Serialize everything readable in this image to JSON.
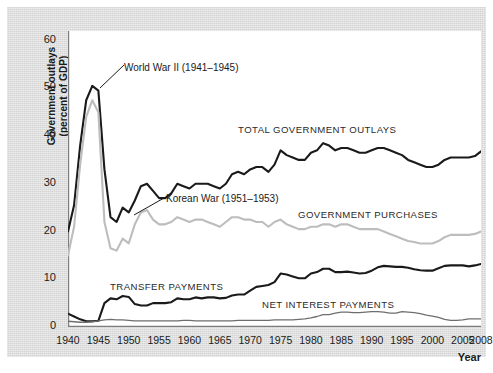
{
  "chart_data": {
    "type": "line",
    "title": "",
    "xlabel": "Year",
    "ylabel": "Government outlays\n(percent of GDP)",
    "xlim": [
      1940,
      2008
    ],
    "ylim": [
      0,
      62
    ],
    "ytick_values": [
      0,
      10,
      20,
      30,
      40,
      50,
      60
    ],
    "ytick_labels": [
      "0",
      "10",
      "20",
      "30",
      "40",
      "50",
      "60"
    ],
    "xtick_values": [
      1940,
      1945,
      1950,
      1955,
      1960,
      1965,
      1970,
      1975,
      1980,
      1985,
      1990,
      1995,
      2000,
      2005,
      2008
    ],
    "xtick_labels": [
      "1940",
      "1945",
      "1950",
      "1955",
      "1960",
      "1965",
      "1970",
      "1975",
      "1980",
      "1985",
      "1990",
      "1995",
      "2000",
      "2005",
      "2008"
    ],
    "grid": false,
    "legend_position": "inline-labels",
    "x": [
      1940,
      1941,
      1942,
      1943,
      1944,
      1945,
      1946,
      1947,
      1948,
      1949,
      1950,
      1951,
      1952,
      1953,
      1954,
      1955,
      1956,
      1957,
      1958,
      1959,
      1960,
      1961,
      1962,
      1963,
      1964,
      1965,
      1966,
      1967,
      1968,
      1969,
      1970,
      1971,
      1972,
      1973,
      1974,
      1975,
      1976,
      1977,
      1978,
      1979,
      1980,
      1981,
      1982,
      1983,
      1984,
      1985,
      1986,
      1987,
      1988,
      1989,
      1990,
      1991,
      1992,
      1993,
      1994,
      1995,
      1996,
      1997,
      1998,
      1999,
      2000,
      2001,
      2002,
      2003,
      2004,
      2005,
      2006,
      2007,
      2008
    ],
    "series": [
      {
        "name": "TOTAL GOVERNMENT OUTLAYS",
        "color": "#1a1a1a",
        "width": 2.1,
        "values": [
          20.0,
          25.5,
          38.0,
          47.5,
          50.5,
          49.5,
          33.0,
          23.0,
          22.0,
          25.0,
          24.0,
          26.5,
          29.5,
          30.0,
          28.5,
          27.0,
          27.0,
          28.0,
          30.0,
          29.5,
          29.0,
          30.0,
          30.0,
          30.0,
          29.5,
          29.0,
          30.0,
          32.0,
          32.5,
          32.0,
          33.0,
          33.5,
          33.5,
          32.5,
          34.0,
          37.0,
          36.0,
          35.5,
          35.0,
          35.0,
          36.5,
          37.0,
          38.5,
          38.0,
          37.0,
          37.5,
          37.5,
          37.0,
          36.5,
          36.5,
          37.0,
          37.5,
          37.5,
          37.0,
          36.5,
          36.0,
          35.0,
          34.5,
          34.0,
          33.5,
          33.5,
          34.0,
          35.0,
          35.5,
          35.5,
          35.5,
          35.5,
          35.8,
          36.8
        ]
      },
      {
        "name": "GOVERNMENT PURCHASES",
        "color": "#bdbdbd",
        "width": 2.1,
        "values": [
          15.0,
          21.0,
          34.0,
          44.0,
          47.5,
          45.0,
          22.0,
          16.5,
          16.0,
          18.5,
          17.5,
          21.5,
          24.0,
          24.5,
          22.5,
          21.5,
          21.5,
          22.0,
          23.0,
          22.5,
          22.0,
          22.5,
          22.5,
          22.0,
          21.5,
          21.0,
          22.0,
          23.0,
          23.0,
          22.5,
          22.5,
          22.0,
          22.0,
          21.0,
          22.0,
          22.5,
          21.5,
          21.0,
          20.5,
          20.5,
          21.0,
          21.0,
          21.5,
          21.5,
          21.0,
          21.5,
          21.5,
          21.0,
          20.5,
          20.5,
          20.5,
          20.5,
          20.0,
          19.5,
          19.0,
          18.5,
          18.0,
          17.8,
          17.5,
          17.5,
          17.5,
          18.0,
          18.8,
          19.3,
          19.3,
          19.3,
          19.3,
          19.5,
          20.0
        ]
      },
      {
        "name": "TRANSFER PAYMENTS",
        "color": "#1a1a1a",
        "width": 2.1,
        "values": [
          2.8,
          2.2,
          1.6,
          1.2,
          1.2,
          1.3,
          5.0,
          6.0,
          5.8,
          6.5,
          6.3,
          4.8,
          4.5,
          4.5,
          5.0,
          5.0,
          5.0,
          5.2,
          6.0,
          5.8,
          5.8,
          6.2,
          6.0,
          6.2,
          6.2,
          6.0,
          6.1,
          6.6,
          6.8,
          6.8,
          7.6,
          8.4,
          8.6,
          8.8,
          9.4,
          11.2,
          11.0,
          10.6,
          10.2,
          10.2,
          11.2,
          11.5,
          12.2,
          12.2,
          11.5,
          11.5,
          11.6,
          11.4,
          11.2,
          11.3,
          11.8,
          12.5,
          12.8,
          12.7,
          12.6,
          12.6,
          12.4,
          12.1,
          11.9,
          11.8,
          11.8,
          12.3,
          12.8,
          12.9,
          12.9,
          12.9,
          12.7,
          12.9,
          13.2
        ]
      },
      {
        "name": "NET INTEREST PAYMENTS",
        "color": "#6e6e6e",
        "width": 1.3,
        "values": [
          1.2,
          1.1,
          1.0,
          1.0,
          1.1,
          1.3,
          1.5,
          1.6,
          1.5,
          1.5,
          1.4,
          1.3,
          1.3,
          1.3,
          1.3,
          1.3,
          1.3,
          1.3,
          1.3,
          1.4,
          1.4,
          1.3,
          1.3,
          1.3,
          1.3,
          1.3,
          1.3,
          1.3,
          1.4,
          1.4,
          1.4,
          1.4,
          1.4,
          1.4,
          1.5,
          1.5,
          1.5,
          1.5,
          1.6,
          1.7,
          1.9,
          2.2,
          2.6,
          2.6,
          2.9,
          3.1,
          3.1,
          3.0,
          3.0,
          3.1,
          3.2,
          3.2,
          3.1,
          2.9,
          2.9,
          3.2,
          3.1,
          3.0,
          2.8,
          2.5,
          2.3,
          2.0,
          1.6,
          1.4,
          1.4,
          1.5,
          1.7,
          1.7,
          1.7
        ]
      }
    ],
    "annotations": [
      {
        "text": "World War II (1941–1945)",
        "name": "world-war-2-annotation"
      },
      {
        "text": "Korean War (1951–1953)",
        "name": "korean-war-annotation"
      }
    ]
  }
}
